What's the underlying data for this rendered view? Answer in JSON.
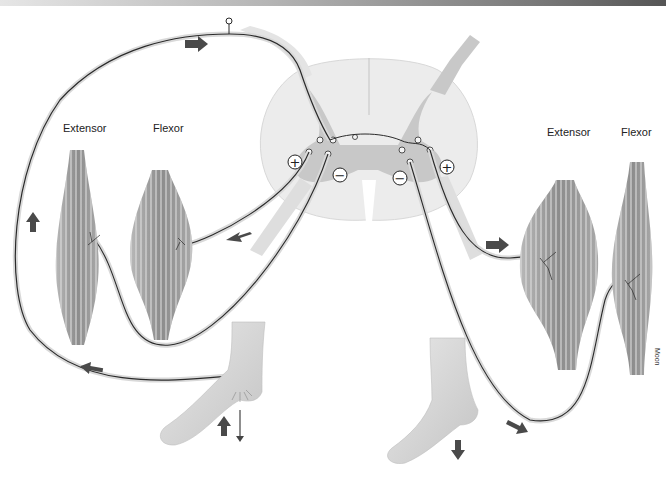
{
  "figure": {
    "type": "anatomical-diagram",
    "labels": {
      "left_extensor": "Extensor",
      "left_flexor": "Flexor",
      "right_extensor": "Extensor",
      "right_flexor": "Flexor",
      "artist_signature": "Moon"
    },
    "symbols": {
      "left_excitatory": "+",
      "left_inhibitory": "−",
      "right_inhibitory": "−",
      "right_excitatory": "+"
    },
    "colors": {
      "background": "#ffffff",
      "spinal_cord_white_matter": "#ececec",
      "spinal_cord_gray_matter": "#c8c8c8",
      "muscle": "#9a9a9a",
      "nerve": "#2a2a2a",
      "arrow": "#4a4a4a",
      "skin": "#d8d8d8"
    },
    "elements": [
      "spinal-cord-cross-section",
      "sensory-neuron",
      "left-extensor-muscle",
      "left-flexor-muscle",
      "right-extensor-muscle",
      "right-flexor-muscle",
      "left-foot-stimulated",
      "right-foot",
      "tack-stimulus",
      "direction-arrows"
    ]
  }
}
